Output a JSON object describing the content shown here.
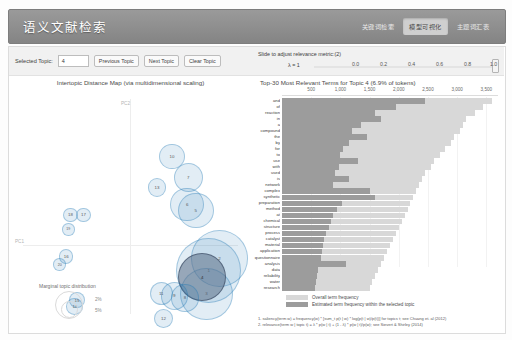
{
  "header": {
    "brand": "语义文献检索",
    "nav": [
      {
        "label": "关键词检索",
        "active": false
      },
      {
        "label": "模型可视化",
        "active": true
      },
      {
        "label": "主题词汇表",
        "active": false
      }
    ]
  },
  "toolbar_left": {
    "selected_topic_label": "Selected Topic:",
    "selected_topic_value": "4",
    "previous_topic": "Previous Topic",
    "next_topic": "Next Topic",
    "clear_topic": "Clear Topic"
  },
  "toolbar_right": {
    "slider_title": "Slide to adjust relevance metric:(2)",
    "lambda_label": "λ = 1",
    "ticks": [
      "0.0",
      "0.2",
      "0.4",
      "0.6",
      "0.8",
      "1.0"
    ],
    "value": 1.0
  },
  "left_chart": {
    "title": "Intertopic Distance Map (via multidimensional scaling)",
    "axis_x": "PC1",
    "axis_y": "PC2",
    "marginal_title": "Marginal topic distribution",
    "marginal_sizes": [
      "2%",
      "5%"
    ]
  },
  "right_chart": {
    "title": "Top-30 Most Relevant Terms for Topic 4 (6.9% of tokens)",
    "legend": [
      "Overall term frequency",
      "Estimated term frequency within the selected topic"
    ],
    "notes": [
      "1. saliency(term w) = frequency(w) * [sum_t p(t | w) * log(p(t | w)/p(t))] for topics t; see Chuang et. al (2012)",
      "2. relevance(term w | topic t) = λ * p(w | t) + (1 - λ) * p(w | t)/p(w); see Sievert & Shirley (2014)"
    ]
  },
  "chart_data": [
    {
      "type": "scatter",
      "title": "Intertopic Distance Map (via multidimensional scaling)",
      "xlabel": "PC1",
      "ylabel": "PC2",
      "selected_topic": 4,
      "points": [
        {
          "topic": 1,
          "x": 0.72,
          "y": -0.24,
          "size": 30
        },
        {
          "topic": 2,
          "x": 0.82,
          "y": -0.12,
          "size": 26
        },
        {
          "topic": 3,
          "x": 0.7,
          "y": -0.46,
          "size": 24
        },
        {
          "topic": 4,
          "x": 0.66,
          "y": -0.3,
          "size": 22
        },
        {
          "topic": 5,
          "x": 0.6,
          "y": 0.34,
          "size": 16
        },
        {
          "topic": 6,
          "x": 0.52,
          "y": 0.4,
          "size": 15
        },
        {
          "topic": 7,
          "x": 0.53,
          "y": 0.66,
          "size": 13
        },
        {
          "topic": 8,
          "x": 0.5,
          "y": -0.5,
          "size": 12
        },
        {
          "topic": 9,
          "x": 0.4,
          "y": -0.48,
          "size": 12
        },
        {
          "topic": 10,
          "x": 0.38,
          "y": 0.86,
          "size": 11
        },
        {
          "topic": 11,
          "x": 0.28,
          "y": -0.46,
          "size": 10
        },
        {
          "topic": 12,
          "x": 0.3,
          "y": -0.7,
          "size": 8
        },
        {
          "topic": 13,
          "x": 0.24,
          "y": 0.56,
          "size": 8
        },
        {
          "topic": 14,
          "x": -0.52,
          "y": -0.58,
          "size": 7
        },
        {
          "topic": 15,
          "x": -0.5,
          "y": -0.52,
          "size": 7
        },
        {
          "topic": 16,
          "x": -0.6,
          "y": -0.1,
          "size": 6
        },
        {
          "topic": 17,
          "x": -0.44,
          "y": 0.3,
          "size": 6
        },
        {
          "topic": 18,
          "x": -0.56,
          "y": 0.3,
          "size": 6
        },
        {
          "topic": 19,
          "x": -0.58,
          "y": 0.16,
          "size": 5
        },
        {
          "topic": 20,
          "x": -0.66,
          "y": -0.18,
          "size": 5
        }
      ]
    },
    {
      "type": "bar",
      "orientation": "horizontal",
      "title": "Top-30 Most Relevant Terms for Topic 4 (6.9% of tokens)",
      "xlabel": "",
      "ylabel": "",
      "xlim": [
        0,
        3700
      ],
      "xticks": [
        500,
        1000,
        1500,
        2000,
        2500,
        3000,
        3500
      ],
      "xtick_labels": [
        "500",
        "1,000",
        "1,500",
        "2,000",
        "2,500",
        "3,000",
        "3,500"
      ],
      "categories": [
        "and",
        "of",
        "reaction",
        "in",
        "a",
        "compound",
        "the",
        "by",
        "for",
        "to",
        "use",
        "with",
        "used",
        "is",
        "network",
        "complex",
        "synthetic",
        "preparation",
        "method",
        "at",
        "chemical",
        "structure",
        "process",
        "catalyst",
        "material",
        "application",
        "questionnaire",
        "analysis",
        "data",
        "reliability",
        "water",
        "research"
      ],
      "series": [
        {
          "name": "Overall term frequency",
          "values": [
            3600,
            3450,
            3300,
            3150,
            3100,
            3050,
            2950,
            2900,
            2800,
            2700,
            2600,
            2550,
            2450,
            2400,
            2350,
            2300,
            2250,
            2200,
            2150,
            2100,
            2050,
            2000,
            1950,
            1900,
            1850,
            1800,
            1750,
            1700,
            1650,
            1600,
            1550,
            1500
          ]
        },
        {
          "name": "Estimated term frequency within the selected topic",
          "values": [
            2450,
            1950,
            1600,
            1700,
            1350,
            1200,
            1450,
            1150,
            1050,
            1000,
            1300,
            980,
            900,
            1150,
            870,
            1500,
            1600,
            1020,
            950,
            880,
            840,
            800,
            760,
            720,
            700,
            680,
            660,
            1100,
            620,
            600,
            580,
            560
          ]
        }
      ]
    }
  ]
}
